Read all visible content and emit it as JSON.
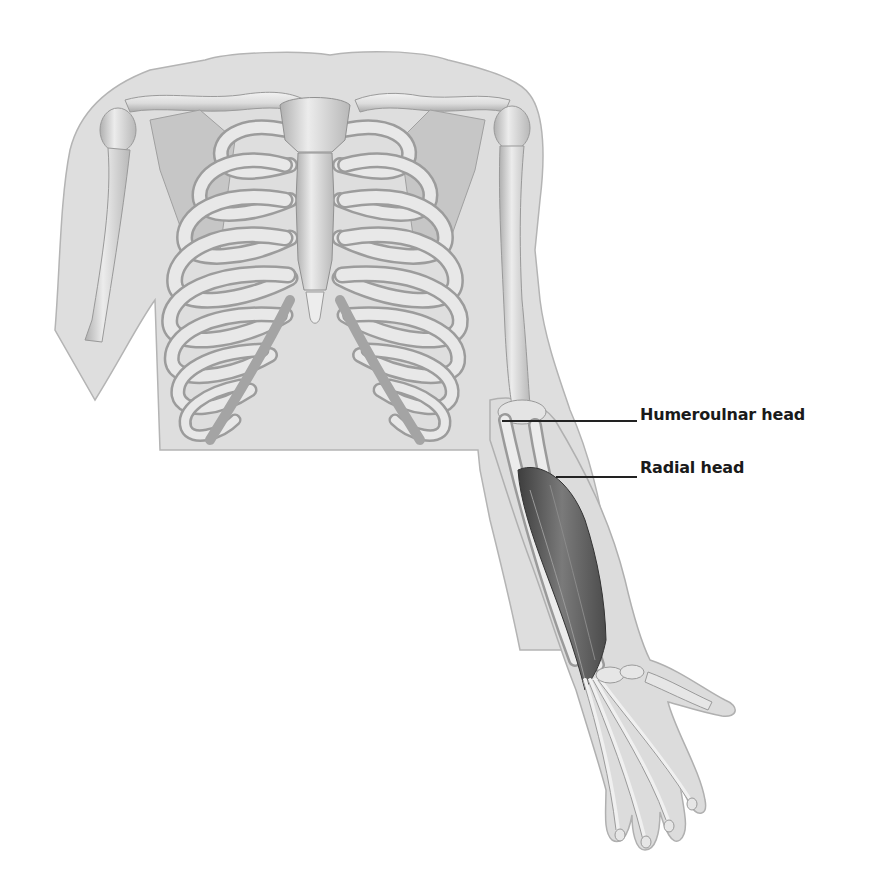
{
  "figure": {
    "colors": {
      "skin": "#dcdcdc",
      "skin_outline": "#b4b4b4",
      "bone": "#e6e6e6",
      "bone_shade": "#a8a8a8",
      "cartilage": "#bdbdbd",
      "muscle": "#6e6e6e",
      "muscle_dark": "#4a4a4a",
      "leader_line": "#222222",
      "label_text": "#1a1a1a"
    }
  },
  "labels": [
    {
      "id": "humeroulnar",
      "text": "Humeroulnar head",
      "x": 640,
      "y": 405,
      "line_x1": 502,
      "line_x2": 637,
      "line_y": 420
    },
    {
      "id": "radial",
      "text": "Radial head",
      "x": 640,
      "y": 458,
      "line_x1": 556,
      "line_x2": 637,
      "line_y": 476
    }
  ]
}
